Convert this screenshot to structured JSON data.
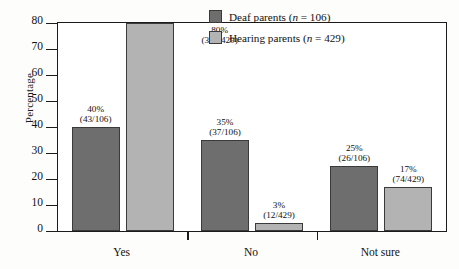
{
  "chart_data": {
    "type": "bar",
    "title": "",
    "xlabel": "",
    "ylabel": "Percentage",
    "ylim": [
      0,
      80
    ],
    "yticks": [
      0,
      10,
      20,
      30,
      40,
      50,
      60,
      70,
      80
    ],
    "ytick_labels": [
      "0",
      "10",
      "20",
      "30",
      "40",
      "50",
      "60",
      "70",
      "80"
    ],
    "grid": false,
    "legend_position": "top-right-inside",
    "categories": [
      "Yes",
      "No",
      "Not sure"
    ],
    "series": [
      {
        "name": "Deaf parents (n = 106)",
        "color": "#6e6e6e",
        "values": [
          40,
          35,
          25
        ],
        "labels": [
          "40%",
          "35%",
          "25%"
        ],
        "fractions": [
          "(43/106)",
          "(37/106)",
          "(26/106)"
        ]
      },
      {
        "name": "Hearing parents (n = 429)",
        "color": "#b3b3b3",
        "values": [
          80,
          3,
          17
        ],
        "labels": [
          "80%",
          "3%",
          "17%"
        ],
        "fractions": [
          "(343/429)",
          "(12/429)",
          "(74/429)"
        ]
      }
    ]
  },
  "legend": {
    "entries": [
      {
        "label_prefix": "Deaf parents (",
        "label_var": "n",
        "label_suffix": " = 106)",
        "color": "#6e6e6e"
      },
      {
        "label_prefix": "Hearing parents (",
        "label_var": "n",
        "label_suffix": " = 429)",
        "color": "#b3b3b3"
      }
    ]
  },
  "axis": {
    "y_title": "Percentage"
  }
}
